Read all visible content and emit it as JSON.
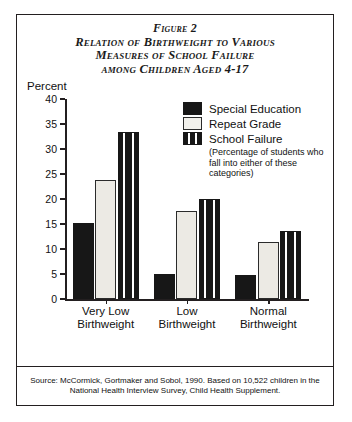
{
  "title": {
    "line1": "Figure 2",
    "line2": "Relation of Birthweight to Various",
    "line3": "Measures of School Failure",
    "line4": "among Children Aged 4-17"
  },
  "axis": {
    "y_label": "Percent",
    "y_ticks": [
      "0",
      "5",
      "10",
      "15",
      "20",
      "25",
      "30",
      "35",
      "40"
    ]
  },
  "legend": {
    "items": [
      {
        "label": "Special Education",
        "swatch": "solid-black-swatch"
      },
      {
        "label": "Repeat Grade",
        "swatch": "white-outline-swatch"
      },
      {
        "label": "School Failure",
        "swatch": "striped-black-swatch"
      }
    ],
    "note_line1": "(Percentage of students who",
    "note_line2": "fall into either of these",
    "note_line3": "categories)"
  },
  "categories": [
    {
      "line1": "Very Low",
      "line2": "Birthweight"
    },
    {
      "line1": "Low",
      "line2": "Birthweight"
    },
    {
      "line1": "Normal",
      "line2": "Birthweight"
    }
  ],
  "source": {
    "line1": "Source: McCormick, Gortmaker and Sobol, 1990. Based on 10,522 children in the",
    "line2": "National Health Interview Survey, Child Health Supplement."
  },
  "colors": {
    "ink": "#231f20",
    "bar_dark": "#171717",
    "bar_light": "#eceae4",
    "background": "#ffffff"
  },
  "chart_data": {
    "type": "bar",
    "title": "Relation of Birthweight to Various Measures of School Failure among Children Aged 4-17",
    "xlabel": "",
    "ylabel": "Percent",
    "ylim": [
      0,
      40
    ],
    "ytick_step": 5,
    "grid": false,
    "legend_position": "upper-right",
    "categories": [
      "Very Low Birthweight",
      "Low Birthweight",
      "Normal Birthweight"
    ],
    "series": [
      {
        "name": "Special Education",
        "values": [
          15.2,
          5.1,
          4.8
        ]
      },
      {
        "name": "Repeat Grade",
        "values": [
          23.8,
          17.7,
          11.4
        ]
      },
      {
        "name": "School Failure",
        "values": [
          33.5,
          20.1,
          13.6
        ]
      }
    ],
    "annotations": [
      "(Percentage of students who fall into either of these categories)",
      "Source: McCormick, Gortmaker and Sobol, 1990. Based on 10,522 children in the National Health Interview Survey, Child Health Supplement."
    ]
  }
}
